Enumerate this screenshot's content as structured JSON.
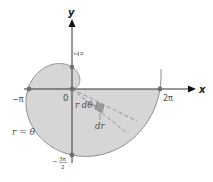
{
  "diagram": {
    "curve_label": "r = θ",
    "axes": {
      "x_label": "x",
      "y_label": "y"
    },
    "tick_labels": {
      "origin": "0",
      "neg_pi": "−π",
      "two_pi": "2π",
      "pi_over_2_num": "π",
      "pi_over_2_den": "2",
      "neg_three_pi_over_2_sign": "−",
      "neg_three_pi_over_2_num": "3π",
      "neg_three_pi_over_2_den": "2"
    },
    "element_labels": {
      "arc_length": "r dθ",
      "radial_length": "dr"
    },
    "colors": {
      "fill": "#d6d6d6",
      "curve": "#8a8a8a",
      "axis": "#333333",
      "point": "#6e6e6e",
      "element": "#9a9a9a",
      "dashed": "#8a8a8a"
    }
  }
}
